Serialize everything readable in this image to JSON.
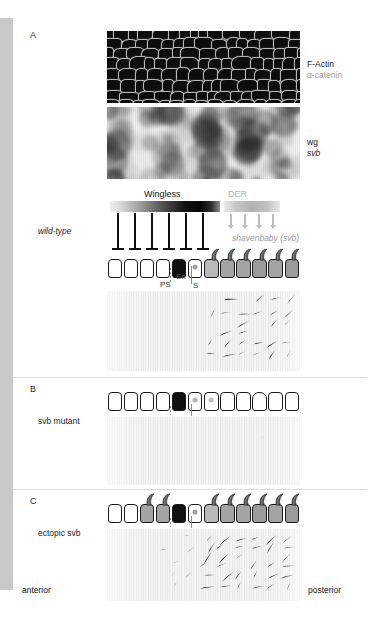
{
  "figure": {
    "panels": [
      {
        "letter": "A",
        "row_label": "wild-type",
        "micrographs": [
          {
            "name": "f-actin-micrograph",
            "labels": [
              "F-Actin",
              "α-catenin"
            ]
          },
          {
            "name": "wg-svb-insitu",
            "labels": [
              "wg",
              "svb"
            ]
          }
        ],
        "gradients": [
          {
            "name": "wingless-gradient",
            "title": "Wingless",
            "color": "#111111"
          },
          {
            "name": "der-gradient",
            "title": "DER",
            "color": "#b0b0b0"
          }
        ],
        "signal_label": "shavenbaby (svb)",
        "cell_markers": [
          "PS",
          "En",
          "S"
        ]
      },
      {
        "letter": "B",
        "row_label_plain": " mutant",
        "row_label_italic": "svb"
      },
      {
        "letter": "C",
        "row_label_plain": "ectopic ",
        "row_label_italic": "svb"
      }
    ],
    "axis": {
      "left": "anterior",
      "right": "posterior"
    },
    "colors": {
      "gutter": "#c9c9c9",
      "ink": "#111111",
      "gray_text": "#9a9a9a",
      "cell_stroke": "#1a1a1a",
      "engrailed_cell": "#101010",
      "nucleus": "#9a9a9a"
    }
  }
}
